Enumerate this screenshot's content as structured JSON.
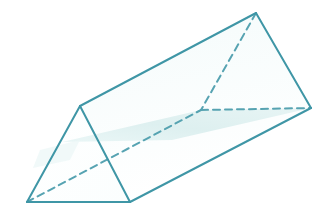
{
  "figure": {
    "name": "triangular-prism",
    "background_color": "#ffffff",
    "stroke_color": "#3f96a6",
    "hidden_edge_color": "#4f9fae",
    "plane_fill_color": "#dff0f0",
    "plane_fill_color_light": "#eaf6f6",
    "face_fill_color": "#ffffff",
    "stroke_width": 2,
    "hidden_stroke_width": 2,
    "hidden_dash_pattern": "7 5"
  },
  "geometry": {
    "vertices": {
      "front_apex": {
        "name": "front-top-apex",
        "x": 80,
        "y": 106
      },
      "front_bottom_left": {
        "name": "front-bottom-left",
        "x": 27,
        "y": 202
      },
      "front_bottom_right": {
        "name": "front-bottom-right",
        "x": 130,
        "y": 202
      },
      "back_apex": {
        "name": "back-top-apex",
        "x": 256,
        "y": 13
      },
      "back_right": {
        "name": "back-bottom-right",
        "x": 311,
        "y": 108
      },
      "back_hidden": {
        "name": "back-bottom-hidden",
        "x": 201,
        "y": 110
      }
    },
    "visible_edges": [
      {
        "name": "front-left-edge",
        "from": "front_apex",
        "to": "front_bottom_left"
      },
      {
        "name": "front-right-edge",
        "from": "front_apex",
        "to": "front_bottom_right"
      },
      {
        "name": "front-base-edge",
        "from": "front_bottom_left",
        "to": "front_bottom_right"
      },
      {
        "name": "top-ridge-edge",
        "from": "front_apex",
        "to": "back_apex"
      },
      {
        "name": "lower-right-long-edge",
        "from": "front_bottom_right",
        "to": "back_right"
      },
      {
        "name": "back-right-upper-edge",
        "from": "back_apex",
        "to": "back_right"
      }
    ],
    "hidden_edges": [
      {
        "name": "hidden-long-bottom-edge",
        "from": "front_bottom_left",
        "to": "back_hidden"
      },
      {
        "name": "hidden-back-left-edge",
        "from": "back_apex",
        "to": "back_hidden"
      },
      {
        "name": "hidden-back-base-edge",
        "from": "back_hidden",
        "to": "back_right"
      }
    ],
    "shaded_plane": {
      "name": "horizontal-cross-section-plane",
      "points": "62,142 201,110 311,108 172,140",
      "extended_points": "62,142 201,110 311,108 172,140"
    }
  },
  "labels": {
    "has_text_labels": false,
    "items": []
  }
}
